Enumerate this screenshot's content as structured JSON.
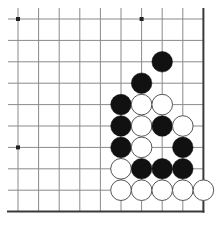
{
  "diagram": {
    "board_section": "bottom-right corner",
    "grid": {
      "columns": 10,
      "rows": 10,
      "x_origin": 18,
      "y_origin": 19,
      "x_step": 20.6,
      "y_step": 21.4,
      "open_left": true,
      "open_top": true,
      "edge_right": true,
      "edge_bottom": true
    },
    "colors": {
      "background": "#ffffff",
      "grid_line": "#8a8a8a",
      "edge_line": "#3a3a3a",
      "black_stone": "#111111",
      "white_stone_fill": "#ffffff",
      "white_stone_outline": "#555555",
      "star_point": "#222222"
    },
    "star_points": [
      {
        "col": 0,
        "row": 0
      },
      {
        "col": 6,
        "row": 0
      },
      {
        "col": 0,
        "row": 6
      }
    ],
    "stones": [
      {
        "color": "black",
        "col": 7,
        "row": 2
      },
      {
        "color": "black",
        "col": 6,
        "row": 3
      },
      {
        "color": "black",
        "col": 5,
        "row": 4
      },
      {
        "color": "white",
        "col": 6,
        "row": 4
      },
      {
        "color": "white",
        "col": 7,
        "row": 4
      },
      {
        "color": "black",
        "col": 5,
        "row": 5
      },
      {
        "color": "white",
        "col": 6,
        "row": 5
      },
      {
        "color": "black",
        "col": 7,
        "row": 5
      },
      {
        "color": "white",
        "col": 8,
        "row": 5
      },
      {
        "color": "black",
        "col": 5,
        "row": 6
      },
      {
        "color": "white",
        "col": 6,
        "row": 6
      },
      {
        "color": "black",
        "col": 8,
        "row": 6
      },
      {
        "color": "white",
        "col": 5,
        "row": 7
      },
      {
        "color": "black",
        "col": 6,
        "row": 7
      },
      {
        "color": "black",
        "col": 7,
        "row": 7
      },
      {
        "color": "black",
        "col": 8,
        "row": 7
      },
      {
        "color": "white",
        "col": 5,
        "row": 8
      },
      {
        "color": "white",
        "col": 6,
        "row": 8
      },
      {
        "color": "white",
        "col": 7,
        "row": 8
      },
      {
        "color": "white",
        "col": 8,
        "row": 8
      },
      {
        "color": "white",
        "col": 9,
        "row": 8
      }
    ],
    "stone_counts": {
      "black": 11,
      "white": 10
    }
  }
}
